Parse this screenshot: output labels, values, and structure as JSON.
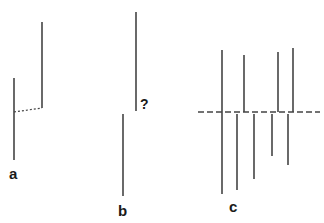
{
  "diagram": {
    "line_color": "#444444",
    "panels": [
      {
        "id": "a",
        "label": "a",
        "lines": [
          {
            "x": 14,
            "y1": 78,
            "y2": 160
          },
          {
            "x": 42,
            "y1": 22,
            "y2": 108
          }
        ],
        "connector": {
          "style": "dotted",
          "x1": 14,
          "y1": 112,
          "x2": 42,
          "y2": 108
        }
      },
      {
        "id": "b",
        "label": "b",
        "question_mark": "?",
        "lines": [
          {
            "x": 136,
            "y1": 12,
            "y2": 111
          },
          {
            "x": 123,
            "y1": 114,
            "y2": 196
          }
        ]
      },
      {
        "id": "c",
        "label": "c",
        "dashed_axis": {
          "x1": 198,
          "x2": 320,
          "y": 112
        },
        "upper_lines": [
          {
            "x": 222,
            "y1": 50,
            "y2": 112
          },
          {
            "x": 244,
            "y1": 55,
            "y2": 112
          },
          {
            "x": 278,
            "y1": 52,
            "y2": 112
          },
          {
            "x": 293,
            "y1": 48,
            "y2": 112
          }
        ],
        "lower_lines": [
          {
            "x": 222,
            "y1": 112,
            "y2": 194
          },
          {
            "x": 237,
            "y1": 114,
            "y2": 190
          },
          {
            "x": 254,
            "y1": 114,
            "y2": 179
          },
          {
            "x": 272,
            "y1": 114,
            "y2": 156
          },
          {
            "x": 288,
            "y1": 114,
            "y2": 165
          }
        ]
      }
    ]
  }
}
